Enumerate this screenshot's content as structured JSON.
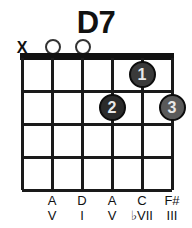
{
  "chord": {
    "title": "D7",
    "strings_count": 6,
    "frets_count": 4,
    "string_markers": [
      "X",
      "O",
      "O",
      "",
      "",
      ""
    ],
    "finger_dots": [
      {
        "label": "1",
        "string": 5,
        "fret": 1,
        "color": "#3a3a3a"
      },
      {
        "label": "2",
        "string": 4,
        "fret": 2,
        "color": "#2b2b2b"
      },
      {
        "label": "3",
        "string": 6,
        "fret": 2,
        "color": "#5a5a5a"
      }
    ],
    "note_labels": [
      {
        "string": 1,
        "name": "",
        "degree": ""
      },
      {
        "string": 2,
        "name": "A",
        "degree": "V"
      },
      {
        "string": 3,
        "name": "D",
        "degree": "I"
      },
      {
        "string": 4,
        "name": "A",
        "degree": "V"
      },
      {
        "string": 5,
        "name": "C",
        "degree": "♭VII"
      },
      {
        "string": 6,
        "name": "F#",
        "degree": "III"
      }
    ],
    "colors": {
      "ink": "#111111",
      "grid": "#1a1a1a",
      "background": "#ffffff"
    }
  }
}
